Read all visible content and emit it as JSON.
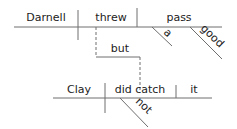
{
  "diagram": {
    "type": "sentence-diagram",
    "style": "Reed-Kellogg",
    "line_color": "#6e6e6e",
    "text_color": "#222222",
    "clause1": {
      "subject": "Darnell",
      "verb": "threw",
      "object": "pass",
      "modifiers": [
        "a",
        "good"
      ]
    },
    "conjunction": "but",
    "clause2": {
      "subject": "Clay",
      "verb": "did catch",
      "object": "it",
      "modifiers": [
        "not"
      ]
    }
  }
}
